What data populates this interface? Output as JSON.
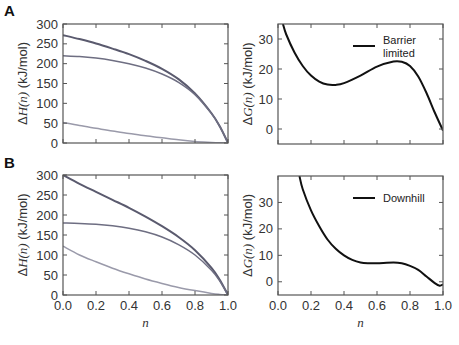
{
  "figure": {
    "panels": [
      {
        "label": "A",
        "row": "top"
      },
      {
        "label": "B",
        "row": "bottom"
      }
    ],
    "caption_visible": false
  },
  "chart_data": [
    {
      "panel": "A-left",
      "type": "line",
      "title": "",
      "xlabel": "",
      "ylabel": "ΔH(n) (kJ/mol)",
      "xlim": [
        0,
        1
      ],
      "ylim": [
        0,
        300
      ],
      "yticks": [
        0,
        50,
        100,
        150,
        200,
        250,
        300
      ],
      "xticks": [
        0.0,
        0.2,
        0.4,
        0.6,
        0.8,
        1.0
      ],
      "xtick_labels_shown": false,
      "grid": false,
      "legend": null,
      "x": [
        0.0,
        0.1,
        0.2,
        0.3,
        0.4,
        0.5,
        0.6,
        0.7,
        0.8,
        0.9,
        0.95,
        1.0
      ],
      "series": [
        {
          "name": "total",
          "color": "#5a5a6e",
          "values": [
            272,
            262,
            251,
            238,
            224,
            207,
            187,
            161,
            125,
            75,
            42,
            0
          ]
        },
        {
          "name": "component-1",
          "color": "#6e6e82",
          "values": [
            220,
            218,
            214,
            208,
            200,
            189,
            174,
            153,
            122,
            74,
            42,
            0
          ]
        },
        {
          "name": "component-2",
          "color": "#9a9aaa",
          "values": [
            52,
            44,
            37,
            30,
            24,
            18,
            13,
            8,
            4,
            1.5,
            0.5,
            0
          ]
        }
      ]
    },
    {
      "panel": "A-right",
      "type": "line",
      "title": "",
      "xlabel": "",
      "ylabel": "ΔG(n) (kJ/mol)",
      "xlim": [
        0,
        1
      ],
      "ylim": [
        -5,
        35
      ],
      "yticks": [
        0,
        10,
        20,
        30
      ],
      "xticks": [
        0.0,
        0.2,
        0.4,
        0.6,
        0.8,
        1.0
      ],
      "xtick_labels_shown": false,
      "grid": false,
      "legend": {
        "position": "upper right",
        "entries": [
          "Barrier limited"
        ]
      },
      "x": [
        0.03,
        0.05,
        0.1,
        0.15,
        0.2,
        0.25,
        0.3,
        0.35,
        0.4,
        0.5,
        0.6,
        0.7,
        0.75,
        0.8,
        0.85,
        0.9,
        0.95,
        1.0
      ],
      "series": [
        {
          "name": "Barrier limited",
          "color": "#111111",
          "values": [
            35,
            31.5,
            25.5,
            21,
            17.8,
            15.8,
            14.8,
            14.7,
            15.3,
            17.8,
            20.8,
            22.5,
            22.4,
            21,
            17.5,
            12,
            5.5,
            -0.5
          ]
        }
      ]
    },
    {
      "panel": "B-left",
      "type": "line",
      "title": "",
      "xlabel": "n",
      "ylabel": "ΔH(n) (kJ/mol)",
      "xlim": [
        0,
        1
      ],
      "ylim": [
        0,
        300
      ],
      "yticks": [
        0,
        50,
        100,
        150,
        200,
        250,
        300
      ],
      "xticks": [
        0.0,
        0.2,
        0.4,
        0.6,
        0.8,
        1.0
      ],
      "xtick_labels": [
        "0.0",
        "0.2",
        "0.4",
        "0.6",
        "0.8",
        "1.0"
      ],
      "grid": false,
      "legend": null,
      "x": [
        0.0,
        0.1,
        0.2,
        0.3,
        0.4,
        0.5,
        0.6,
        0.7,
        0.8,
        0.9,
        0.95,
        1.0
      ],
      "series": [
        {
          "name": "total",
          "color": "#5a5a6e",
          "values": [
            300,
            278,
            258,
            238,
            218,
            196,
            172,
            145,
            112,
            68,
            38,
            0
          ]
        },
        {
          "name": "component-1",
          "color": "#6e6e82",
          "values": [
            180,
            179,
            177,
            173,
            167,
            158,
            145,
            126,
            100,
            62,
            35,
            0
          ]
        },
        {
          "name": "component-2",
          "color": "#9a9aaa",
          "values": [
            122,
            100,
            83,
            67,
            53,
            40,
            29,
            19,
            11,
            4,
            1.5,
            0
          ]
        }
      ]
    },
    {
      "panel": "B-right",
      "type": "line",
      "title": "",
      "xlabel": "n",
      "ylabel": "ΔG(n) (kJ/mol)",
      "xlim": [
        0,
        1
      ],
      "ylim": [
        -5,
        40
      ],
      "yticks": [
        0,
        10,
        20,
        30
      ],
      "xticks": [
        0.0,
        0.2,
        0.4,
        0.6,
        0.8,
        1.0
      ],
      "xtick_labels": [
        "0.0",
        "0.2",
        "0.4",
        "0.6",
        "0.8",
        "1.0"
      ],
      "grid": false,
      "legend": {
        "position": "upper right",
        "entries": [
          "Downhill"
        ]
      },
      "x": [
        0.13,
        0.15,
        0.2,
        0.25,
        0.3,
        0.35,
        0.4,
        0.45,
        0.5,
        0.55,
        0.6,
        0.7,
        0.75,
        0.8,
        0.85,
        0.9,
        0.95,
        0.98,
        1.0
      ],
      "series": [
        {
          "name": "Downhill",
          "color": "#111111",
          "values": [
            40,
            35,
            27,
            21,
            16,
            12.5,
            10,
            8.3,
            7.3,
            7,
            7,
            7.3,
            7,
            6,
            4.5,
            2,
            -0.5,
            -1.5,
            -1
          ]
        }
      ]
    }
  ]
}
